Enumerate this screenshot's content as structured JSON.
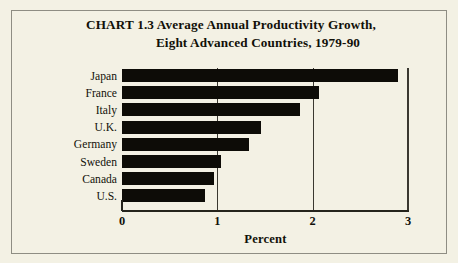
{
  "figure": {
    "background_color": "#f3f1e4",
    "border_color": "#8e8d83",
    "bar_color": "#0d0c07",
    "axis_color": "#25241c"
  },
  "title": {
    "line1": "CHART 1.3   Average Annual Productivity Growth,",
    "line2": "Eight Advanced Countries, 1979-90"
  },
  "chart_data": {
    "type": "bar",
    "orientation": "horizontal",
    "title": "CHART 1.3 Average Annual Productivity Growth, Eight Advanced Countries, 1979-90",
    "xlabel": "Percent",
    "ylabel": "",
    "xlim": [
      0,
      3
    ],
    "xticks": [
      0,
      1,
      2,
      3
    ],
    "xtick_labels": [
      "0",
      "1",
      "2",
      "3"
    ],
    "grid": "vertical-at-1-and-2",
    "legend": "none",
    "categories": [
      "Japan",
      "France",
      "Italy",
      "U.K.",
      "Germany",
      "Sweden",
      "Canada",
      "U.S."
    ],
    "values": [
      2.9,
      2.07,
      1.87,
      1.46,
      1.33,
      1.04,
      0.97,
      0.87
    ]
  }
}
